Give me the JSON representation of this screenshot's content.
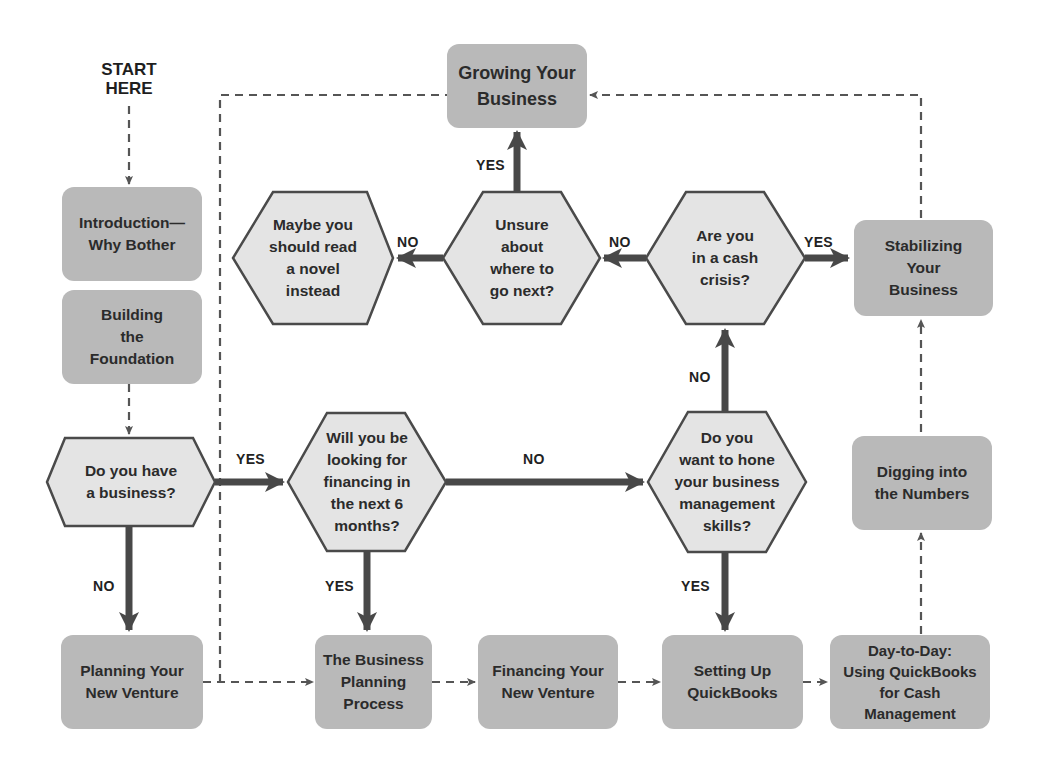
{
  "start": {
    "label": "START\nHERE"
  },
  "boxes": {
    "growing": "Growing Your\nBusiness",
    "introduction": "Introduction—\nWhy Bother",
    "building": "Building\nthe\nFoundation",
    "stabilizing": "Stabilizing\nYour\nBusiness",
    "digging": "Digging into\nthe Numbers",
    "planning": "Planning Your\nNew Venture",
    "business_planning": "The Business\nPlanning\nProcess",
    "financing": "Financing Your\nNew Venture",
    "setting_up": "Setting Up\nQuickBooks",
    "day_to_day": "Day-to-Day:\nUsing QuickBooks\nfor Cash\nManagement"
  },
  "decisions": {
    "novel": "Maybe you\nshould read\na novel\ninstead",
    "unsure": "Unsure\nabout\nwhere to\ngo next?",
    "cash_crisis": "Are you\nin a cash\ncrisis?",
    "have_business": "Do you have\na business?",
    "financing_6mo": "Will you be\nlooking for\nfinancing in\nthe next 6\nmonths?",
    "hone_skills": "Do you\nwant to hone\nyour business\nmanagement\nskills?"
  },
  "edge_labels": {
    "unsure_yes": "YES",
    "unsure_no": "NO",
    "cash_no": "NO",
    "cash_yes": "YES",
    "hone_no": "NO",
    "have_yes": "YES",
    "financing_no": "NO",
    "have_no": "NO",
    "financing_yes": "YES",
    "hone_yes": "YES"
  },
  "colors": {
    "box_fill": "#b9b9b9",
    "hex_fill": "#e4e4e4",
    "stroke": "#4a4a4a",
    "text": "#2b2b2b"
  }
}
